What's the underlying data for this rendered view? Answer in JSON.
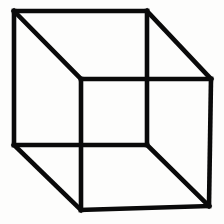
{
  "figure": {
    "name": "Necker cube",
    "alt_text": "Necker cube ambiguous line drawing optical illusion",
    "background_color": "#fdfdfc",
    "stroke_color": "#0a0a0a",
    "stroke_width": 4.6,
    "canvas_width": 224,
    "canvas_height": 224
  },
  "chart_data": {
    "type": "diagram",
    "title": "Necker Cube",
    "subtitle": "",
    "xlabel": "",
    "ylabel": "",
    "grid": false,
    "legend": null,
    "xlim": [
      0,
      224
    ],
    "ylim": [
      0,
      224
    ],
    "vertices": {
      "back_top_left": [
        14,
        11
      ],
      "back_top_right": [
        147,
        11
      ],
      "back_bottom_right": [
        147,
        145
      ],
      "back_bottom_left": [
        14,
        145
      ],
      "front_top_left": [
        81,
        79
      ],
      "front_top_right": [
        211,
        79
      ],
      "front_bottom_right": [
        209,
        206
      ],
      "front_bottom_left": [
        81,
        210
      ]
    },
    "edges": [
      {
        "name": "back-face-top",
        "from": "back_top_left",
        "to": "back_top_right"
      },
      {
        "name": "back-face-right",
        "from": "back_top_right",
        "to": "back_bottom_right"
      },
      {
        "name": "back-face-bottom",
        "from": "back_bottom_right",
        "to": "back_bottom_left"
      },
      {
        "name": "back-face-left",
        "from": "back_bottom_left",
        "to": "back_top_left"
      },
      {
        "name": "front-face-top",
        "from": "front_top_left",
        "to": "front_top_right"
      },
      {
        "name": "front-face-right",
        "from": "front_top_right",
        "to": "front_bottom_right"
      },
      {
        "name": "front-face-bottom",
        "from": "front_bottom_right",
        "to": "front_bottom_left"
      },
      {
        "name": "front-face-left",
        "from": "front_bottom_left",
        "to": "front_top_left"
      },
      {
        "name": "connector-top-left",
        "from": "back_top_left",
        "to": "front_top_left"
      },
      {
        "name": "connector-top-right",
        "from": "back_top_right",
        "to": "front_top_right"
      },
      {
        "name": "connector-bottom-right",
        "from": "back_bottom_right",
        "to": "front_bottom_right"
      },
      {
        "name": "connector-bottom-left",
        "from": "back_bottom_left",
        "to": "front_bottom_left"
      }
    ]
  }
}
